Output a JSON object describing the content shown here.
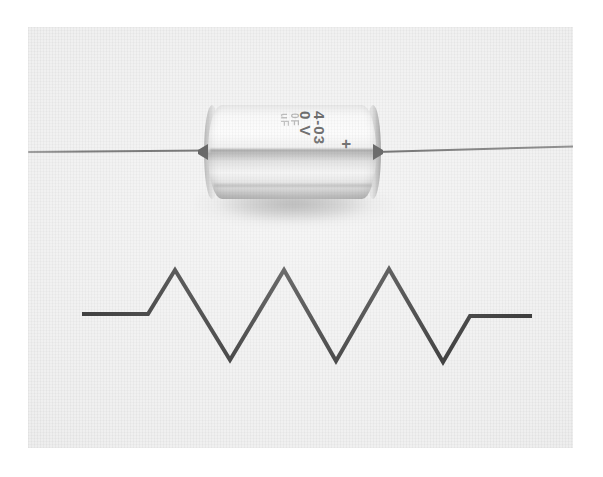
{
  "page": {
    "background_color": "#ffffff",
    "width": 603,
    "height": 477
  },
  "photo": {
    "name": "black-and-white-photograph",
    "background_color": "#eeeeee",
    "left": 28,
    "top": 27,
    "width": 545,
    "height": 421,
    "caption": ""
  },
  "capacitor": {
    "label": "axial lead capacitor",
    "body_color": "#efefef",
    "lead_color": "#3b3b3b",
    "markings": {
      "line1": "4-03",
      "line2": "0 V",
      "line3": "0F",
      "line4": "uF",
      "polarity": "+"
    }
  },
  "schematic": {
    "label": "resistor symbol",
    "stroke_color": "#111111",
    "stroke_width": 4,
    "points": "82,314 148,314 175,270 230,360 284,270 336,361 389,269 443,362 470,316 532,316"
  }
}
